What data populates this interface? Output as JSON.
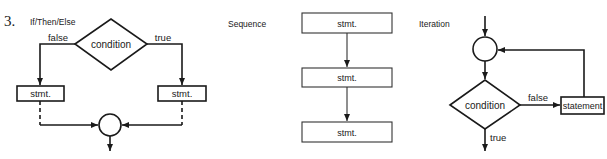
{
  "item_number": "3.",
  "if_then_else": {
    "title": "If/Then/Else",
    "condition_label": "condition",
    "false_label": "false",
    "true_label": "true",
    "left_stmt": "stmt.",
    "right_stmt": "stmt."
  },
  "sequence": {
    "title": "Sequence",
    "stmts": [
      "stmt.",
      "stmt.",
      "stmt."
    ]
  },
  "iteration": {
    "title": "Iteration",
    "condition_label": "condition",
    "false_label": "false",
    "true_label": "true",
    "statement_label": "statement"
  },
  "colors": {
    "stroke": "#1a1a1a",
    "background": "#ffffff"
  }
}
